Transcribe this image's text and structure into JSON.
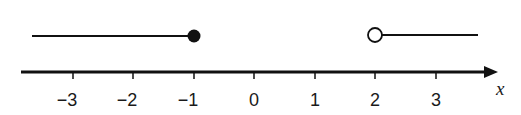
{
  "diagram": {
    "type": "number-line",
    "axis": {
      "variable": "x",
      "ticks": [
        {
          "value": -3,
          "label": "−3",
          "px": 73
        },
        {
          "value": -2,
          "label": "−2",
          "px": 133
        },
        {
          "value": -1,
          "label": "−1",
          "px": 194
        },
        {
          "value": 0,
          "label": "0",
          "px": 254
        },
        {
          "value": 1,
          "label": "1",
          "px": 315
        },
        {
          "value": 2,
          "label": "2",
          "px": 375
        },
        {
          "value": 3,
          "label": "3",
          "px": 436
        }
      ]
    },
    "rays": [
      {
        "direction": "left",
        "endpoint": -1,
        "endpoint_style": "closed"
      },
      {
        "direction": "right",
        "endpoint": 2,
        "endpoint_style": "open"
      }
    ],
    "colors": {
      "stroke": "#111111",
      "background": "#ffffff"
    }
  }
}
